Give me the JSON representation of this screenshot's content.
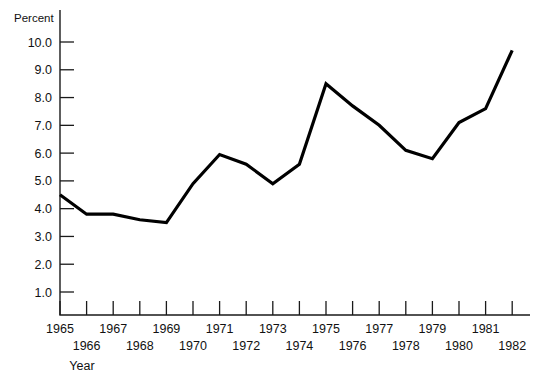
{
  "chart_data": {
    "type": "line",
    "title": "",
    "subtitle": "",
    "xlabel": "Year",
    "ylabel": "Percent",
    "grid": false,
    "legend": null,
    "line_color": "#000000",
    "background_color": "#ffffff",
    "axis_color": "#1a1a1a",
    "xlim": [
      1964.5,
      1982.5
    ],
    "ylim": [
      0.2,
      10.6
    ],
    "yticks": [
      1.0,
      2.0,
      3.0,
      4.0,
      5.0,
      6.0,
      7.0,
      8.0,
      9.0,
      10.0
    ],
    "ytick_labels": [
      "1.0",
      "2.0",
      "3.0",
      "4.0",
      "5.0",
      "6.0",
      "7.0",
      "8.0",
      "9.0",
      "10.0"
    ],
    "xticks": [
      1965,
      1966,
      1967,
      1968,
      1969,
      1970,
      1971,
      1972,
      1973,
      1974,
      1975,
      1976,
      1977,
      1978,
      1979,
      1980,
      1981,
      1982
    ],
    "xtick_labels": [
      "1965",
      "1966",
      "1967",
      "1968",
      "1969",
      "1970",
      "1971",
      "1972",
      "1973",
      "1974",
      "1975",
      "1976",
      "1977",
      "1978",
      "1979",
      "1980",
      "1981",
      "1982"
    ],
    "xtick_label_rows": [
      0,
      1,
      0,
      1,
      0,
      1,
      0,
      1,
      0,
      1,
      0,
      1,
      0,
      1,
      0,
      1,
      0,
      1
    ],
    "categories": [
      1965,
      1966,
      1967,
      1968,
      1969,
      1970,
      1971,
      1972,
      1973,
      1974,
      1975,
      1976,
      1977,
      1978,
      1979,
      1980,
      1981,
      1982
    ],
    "values": [
      4.5,
      3.8,
      3.8,
      3.6,
      3.5,
      4.9,
      5.95,
      5.6,
      4.9,
      5.6,
      8.5,
      7.7,
      7.0,
      6.1,
      5.8,
      7.1,
      7.6,
      9.7
    ],
    "series": [
      {
        "name": "Percent",
        "values": [
          4.5,
          3.8,
          3.8,
          3.6,
          3.5,
          4.9,
          5.95,
          5.6,
          4.9,
          5.6,
          8.5,
          7.7,
          7.0,
          6.1,
          5.8,
          7.1,
          7.6,
          9.7
        ]
      }
    ],
    "annotations": []
  }
}
